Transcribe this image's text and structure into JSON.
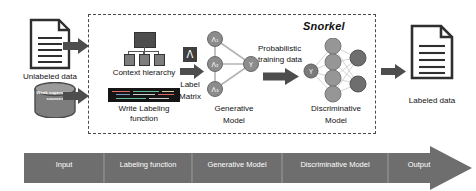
{
  "diagram": {
    "framework_label": "Snorkel",
    "colors": {
      "arrow_gray": "#4d4d4d",
      "banner_gray": "#6e6e6e",
      "node_gray": "#8c8c8c",
      "dark_node": "#6b6b6b",
      "dashed_border": "#4a4a4a",
      "code_bg": "#151515",
      "text": "#111111"
    },
    "inputs": {
      "unlabeled_data": {
        "icon": "document-icon",
        "label": "Unlabeled data"
      },
      "weak_supervision": {
        "icon": "database-cylinder-icon",
        "label": "Weak supervision sources"
      }
    },
    "labeling_function_stage": {
      "context_hierarchy": {
        "icon": "tree-hierarchy-icon",
        "label": "Context hierarchy"
      },
      "write_labeling_function": {
        "icon": "code-block-icon",
        "label_line1": "Write Labeling",
        "label_line2": "function"
      }
    },
    "label_matrix": {
      "glyph": "Λ",
      "label_line1": "Label",
      "label_line2": "Matrix"
    },
    "generative_model": {
      "label_line1": "Generative",
      "label_line2": "Model",
      "nodes": [
        "Λ₁",
        "Λ₂",
        "Λ₃",
        "Y"
      ]
    },
    "probabilistic_training": {
      "label_line1": "Probabilistic",
      "label_line2": "training data"
    },
    "discriminative_model": {
      "label_line1": "Discriminative",
      "label_line2": "Model",
      "input_node": "Y",
      "hidden_units": 4,
      "output_units": 2
    },
    "output": {
      "icon": "document-icon",
      "label": "Labeled data"
    },
    "arrows": [
      {
        "name": "arrow-unlabeled-to-hierarchy"
      },
      {
        "name": "arrow-sources-to-labeling-function"
      },
      {
        "name": "arrow-label-matrix"
      },
      {
        "name": "arrow-probabilistic-training-data"
      },
      {
        "name": "arrow-to-labeled-data"
      }
    ]
  },
  "banner": {
    "stages": [
      {
        "label": "Input"
      },
      {
        "label": "Labeling function"
      },
      {
        "label": "Generative Model"
      },
      {
        "label": "Discriminative Model"
      },
      {
        "label": "Output"
      }
    ]
  }
}
